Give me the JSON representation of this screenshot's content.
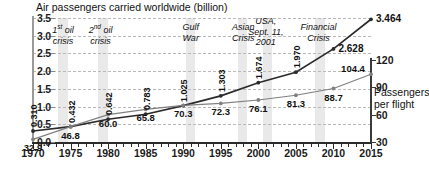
{
  "chart_data": {
    "type": "line",
    "title": "Air passengers carried worldwide (billion)",
    "xlabel": "",
    "ylabel": "",
    "ylim": [
      0.0,
      3.5
    ],
    "y2lim": [
      30,
      120
    ],
    "xlim": [
      1970,
      2015
    ],
    "grid": true,
    "legend_position": "inline-right",
    "x": [
      1970,
      1975,
      1980,
      1985,
      1990,
      1995,
      2000,
      2005,
      2010,
      2015
    ],
    "xticklabels": [
      "1970",
      "1975",
      "1980",
      "1985",
      "1990",
      "1995",
      "2000",
      "2005",
      "2010",
      "2015"
    ],
    "yticklabels_left": [
      "0.0",
      "0.5",
      "1.0",
      "1.5",
      "2.0",
      "2.5",
      "3.0",
      "3.5"
    ],
    "yticklabels_right": [
      "30",
      "60",
      "90",
      "120"
    ],
    "series": [
      {
        "name": "Air passengers carried worldwide (billion)",
        "axis": "left",
        "color": "#2b2b2b",
        "values": [
          0.31,
          0.432,
          0.642,
          0.783,
          1.025,
          1.303,
          1.674,
          1.97,
          2.628,
          3.464
        ],
        "labels": [
          "0.310",
          "0.432",
          "0.642",
          "0.783",
          "1.025",
          "1.303",
          "1.674",
          "1.970",
          "2.628",
          "3.464"
        ]
      },
      {
        "name": "Passengers per flight",
        "axis": "right",
        "color": "#808080",
        "values": [
          32.9,
          46.8,
          60.0,
          65.8,
          70.3,
          72.3,
          76.1,
          81.3,
          88.7,
          104.4
        ],
        "labels": [
          "32.9",
          "46.8",
          "60.0",
          "65.8",
          "70.3",
          "72.3",
          "76.1",
          "81.3",
          "88.7",
          "104.4"
        ]
      }
    ],
    "right_axis_caption": [
      "Passengers",
      "per flight"
    ],
    "annotations": [
      {
        "id": "first-oil-crisis",
        "lines": [
          "1",
          "st",
          " oil",
          "crisis"
        ],
        "text": "1st oil crisis",
        "year": 1974
      },
      {
        "id": "second-oil-crisis",
        "lines": [
          "2",
          "nd",
          " oil",
          "crisis"
        ],
        "text": "2nd oil crisis",
        "year": 1979
      },
      {
        "id": "gulf-war",
        "lines": [
          "Gulf",
          "War"
        ],
        "text": "Gulf War",
        "year": 1991
      },
      {
        "id": "asian-crisis",
        "lines": [
          "Asian",
          "Crisis"
        ],
        "text": "Asian Crisis",
        "year": 1998
      },
      {
        "id": "usa-sept-11",
        "lines": [
          "USA,",
          "Sept. 11,",
          "2001"
        ],
        "text": "USA, Sept. 11, 2001",
        "year": 2001
      },
      {
        "id": "financial-crisis",
        "lines": [
          "Financial",
          "Crisis"
        ],
        "text": "Financial Crisis",
        "year": 2008
      }
    ],
    "shaded_bands": [
      {
        "id": "band-first-oil-crisis",
        "year_start": 1973.3,
        "year_end": 1974.6
      },
      {
        "id": "band-second-oil-crisis",
        "year_start": 1978.7,
        "year_end": 1980.0
      },
      {
        "id": "band-gulf-war",
        "year_start": 1990.4,
        "year_end": 1991.6
      },
      {
        "id": "band-asian-crisis",
        "year_start": 1997.3,
        "year_end": 1998.5
      },
      {
        "id": "band-sept-11",
        "year_start": 2000.6,
        "year_end": 2001.8
      },
      {
        "id": "band-financial-crisis",
        "year_start": 2007.6,
        "year_end": 2008.9
      }
    ],
    "colors": {
      "passengers_line": "#2b2b2b",
      "per_flight_line": "#808080",
      "band": "#e9e9e9",
      "grid": "#b9b9b9",
      "axis": "#2b2b2b",
      "text": "#111111"
    }
  }
}
